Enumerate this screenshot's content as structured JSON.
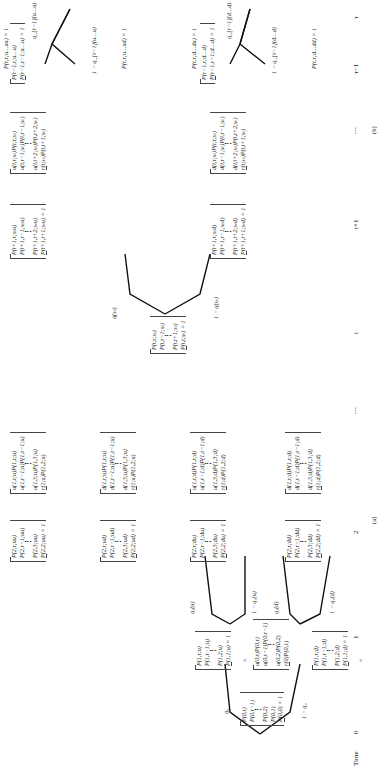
{
  "panel_a": {
    "caption": "(a)",
    "root": {
      "lines": [
        "P(0,τ)",
        "P(0,τ−1)",
        "⋮",
        "P(0,2)",
        "P(0,1)",
        "P(0,0) = 1"
      ]
    },
    "branch_up_label": "q₀",
    "branch_down_label": "1 − q₀",
    "node_1u": {
      "lines": [
        "P(1,τ;u)",
        "P(1,τ−1;u)",
        "⋮",
        "P(1,2;u)",
        "P(1,1;u) = 1"
      ]
    },
    "node_1d": {
      "lines": [
        "P(1,τ;d)",
        "P(1,τ−1;d)",
        "⋮",
        "P(1,2;d)",
        "P(1,1;d) = 1"
      ]
    },
    "eq_1u": {
      "lines": [
        "u(0,τ)P(0,τ)",
        "u(0,τ−1)P(0,τ−1)",
        "⋮",
        "u(0,2)P(0,2)",
        "r(0)P(0,1)"
      ]
    },
    "eq_1d": {
      "lines": [
        "d(0,τ)P(0,τ)",
        "d(0,τ−1)P(0,τ−1)",
        "⋮",
        "d(0,2)P(0,2)",
        "r(0)P(0,1)"
      ]
    },
    "q1u_up": "q₁(u)",
    "q1u_down": "1 − q₁(u)",
    "q1d_up": "q₁(d)",
    "q1d_down": "1 − q₁(d)",
    "node_2uu": {
      "lines": [
        "P(2,τ;uu)",
        "P(2,τ−1;uu)",
        "⋮",
        "P(2,3;uu)",
        "P(2,2;uu) = 1"
      ]
    },
    "node_2ud": {
      "lines": [
        "P(2,τ;ud)",
        "P(2,τ−1;ud)",
        "⋮",
        "P(2,3;ud)",
        "P(2,2;ud) = 1"
      ]
    },
    "node_2du": {
      "lines": [
        "P(2,τ;du)",
        "P(2,τ−1;du)",
        "⋮",
        "P(2,3;du)",
        "P(2,2;du) = 1"
      ]
    },
    "node_2dd": {
      "lines": [
        "P(2,τ;dd)",
        "P(2,τ−1;dd)",
        "⋮",
        "P(2,3;dd)",
        "P(2,2;dd) = 1"
      ]
    },
    "eq_2uu": {
      "lines": [
        "u(1,τ;u)P(1,τ;u)",
        "u(1,τ−1;u)P(1,τ−1;u)",
        "⋮",
        "u(1,3;u)P(1,3;u)",
        "r(1;u)P(1,2;u)"
      ]
    },
    "eq_2ud": {
      "lines": [
        "d(1,τ;u)P(1,τ;u)",
        "d(1,τ−1;u)P(1,τ−1;u)",
        "⋮",
        "d(1,3;u)P(1,3;u)",
        "r(1;u)P(1,2;u)"
      ]
    },
    "eq_2du": {
      "lines": [
        "u(1,τ;d)P(1,τ;d)",
        "u(1,τ−1;d)P(1,τ−1;d)",
        "⋮",
        "u(1,3;d)P(1,3;d)",
        "r(1;d)P(1,2;d)"
      ]
    },
    "eq_2dd": {
      "lines": [
        "d(1,τ;d)P(1,τ;d)",
        "d(1,τ−1;d)P(1,τ−1;d)",
        "⋮",
        "d(1,3;d)P(1,3;d)",
        "r(1;d)P(1,2;d)"
      ]
    }
  },
  "panel_b": {
    "caption": "(b)",
    "node_t": {
      "lines": [
        "P(t,τ;sₜ)",
        "P(t,τ−1;sₜ)",
        "⋮",
        "P(t,t+1;sₜ)",
        "P(t,t;sₜ) = 1"
      ]
    },
    "q_up": "q(sₜ)",
    "q_down": "1 − q(sₜ)",
    "node_t1u": {
      "lines": [
        "P(t+1,τ;sₜu)",
        "P(t+1,τ−1;sₜu)",
        "⋮",
        "P(t+1,t+2;sₜu)",
        "P(t+1,t+1;sₜu) = 1"
      ]
    },
    "node_t1d": {
      "lines": [
        "P(t+1,τ;sₜd)",
        "P(t+1,τ−1;sₜd)",
        "⋮",
        "P(t+1,t+2;sₜd)",
        "P(t+1,t+1;sₜd) = 1"
      ]
    },
    "eq_t1u": {
      "lines": [
        "u(t,τ;sₜ)P(t,τ;sₜ)",
        "u(t,τ−1;sₜ)P(t,τ−1;sₜ)",
        "⋮",
        "u(t,t+2;sₜ)P(t,t+2;sₜ)",
        "r(t;sₜ)P(t,t+1;sₜ)"
      ]
    },
    "eq_t1d": {
      "lines": [
        "d(t,τ;sₜ)P(t,τ;sₜ)",
        "d(t,τ−1;sₜ)P(t,τ−1;sₜ)",
        "⋮",
        "d(t,t+2;sₜ)P(t,t+2;sₜ)",
        "r(t;sₜ)P(t,t+1;sₜ)"
      ]
    },
    "node_top": {
      "lines": [
        "P(τ−1,τ;u…u)",
        "P(τ−1,τ−1;u…u) = 1"
      ]
    },
    "node_bot": {
      "lines": [
        "P(τ−1,τ;d…d)",
        "P(τ−1,τ−1;d…d) = 1"
      ]
    },
    "top_up": "q_{τ−1}(u…u)",
    "top_down": "1 − q_{τ−1}(u…u)",
    "bot_up": "q_{τ−1}(d…d)",
    "bot_down": "1 − q_{τ−1}(d…d)",
    "leaf_uuu": "P(τ,τ;u…uu) = 1",
    "leaf_uud": "P(τ,τ;u…ud) = 1",
    "leaf_ddu": "P(τ,τ;d…du) = 1",
    "leaf_ddd": "P(τ,τ;d…dd) = 1"
  },
  "time_axis": {
    "label": "Time",
    "ticks": [
      "0",
      "1",
      "2",
      "⋯",
      "t",
      "t+1",
      "⋯",
      "τ−1",
      "τ"
    ]
  },
  "equals_sign": "="
}
